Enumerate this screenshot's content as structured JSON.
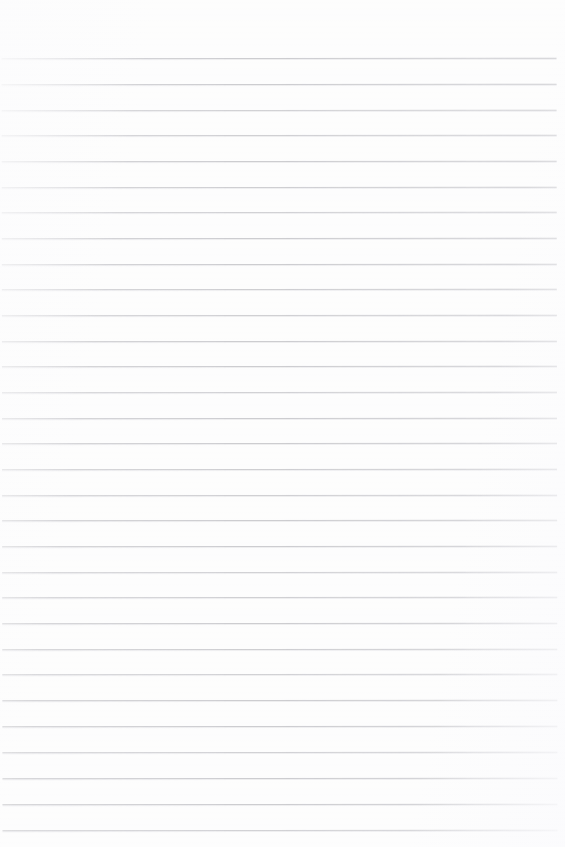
{
  "document": {
    "kind": "ruled-paper-scan",
    "title": "Blank Ruled Paper",
    "page_width": 565,
    "page_height": 847,
    "background_color": "#fdfdfd",
    "has_text_content": false,
    "body_text": "",
    "margins": {
      "top": 58,
      "bottom": 17,
      "left": 2,
      "right": 8
    }
  },
  "ruling": {
    "line_color": "#c9c9cd",
    "line_thickness_px": 1,
    "line_spacing_px": 25.8,
    "line_count": 31,
    "first_line_y": 58,
    "last_line_y": 830,
    "line_start_x": 2,
    "line_end_x": 557,
    "tilt_degrees": -0.07,
    "lines": [
      {
        "index": 1,
        "y": 58,
        "x1": 2,
        "x2": 557
      },
      {
        "index": 2,
        "y": 84,
        "x1": 2,
        "x2": 557
      },
      {
        "index": 3,
        "y": 110,
        "x1": 2,
        "x2": 557
      },
      {
        "index": 4,
        "y": 135,
        "x1": 2,
        "x2": 557
      },
      {
        "index": 5,
        "y": 161,
        "x1": 2,
        "x2": 557
      },
      {
        "index": 6,
        "y": 187,
        "x1": 2,
        "x2": 557
      },
      {
        "index": 7,
        "y": 212,
        "x1": 2,
        "x2": 557
      },
      {
        "index": 8,
        "y": 238,
        "x1": 2,
        "x2": 557
      },
      {
        "index": 9,
        "y": 264,
        "x1": 2,
        "x2": 557
      },
      {
        "index": 10,
        "y": 289,
        "x1": 2,
        "x2": 557
      },
      {
        "index": 11,
        "y": 315,
        "x1": 2,
        "x2": 557
      },
      {
        "index": 12,
        "y": 341,
        "x1": 2,
        "x2": 557
      },
      {
        "index": 13,
        "y": 366,
        "x1": 2,
        "x2": 557
      },
      {
        "index": 14,
        "y": 392,
        "x1": 2,
        "x2": 557
      },
      {
        "index": 15,
        "y": 418,
        "x1": 2,
        "x2": 557
      },
      {
        "index": 16,
        "y": 443,
        "x1": 2,
        "x2": 557
      },
      {
        "index": 17,
        "y": 469,
        "x1": 2,
        "x2": 557
      },
      {
        "index": 18,
        "y": 495,
        "x1": 2,
        "x2": 557
      },
      {
        "index": 19,
        "y": 520,
        "x1": 2,
        "x2": 557
      },
      {
        "index": 20,
        "y": 546,
        "x1": 2,
        "x2": 557
      },
      {
        "index": 21,
        "y": 572,
        "x1": 2,
        "x2": 557
      },
      {
        "index": 22,
        "y": 597,
        "x1": 2,
        "x2": 557
      },
      {
        "index": 23,
        "y": 623,
        "x1": 2,
        "x2": 557
      },
      {
        "index": 24,
        "y": 649,
        "x1": 2,
        "x2": 557
      },
      {
        "index": 25,
        "y": 674,
        "x1": 2,
        "x2": 557
      },
      {
        "index": 26,
        "y": 700,
        "x1": 2,
        "x2": 557
      },
      {
        "index": 27,
        "y": 726,
        "x1": 2,
        "x2": 557
      },
      {
        "index": 28,
        "y": 752,
        "x1": 2,
        "x2": 557
      },
      {
        "index": 29,
        "y": 778,
        "x1": 2,
        "x2": 557
      },
      {
        "index": 30,
        "y": 804,
        "x1": 2,
        "x2": 557
      },
      {
        "index": 31,
        "y": 830,
        "x1": 2,
        "x2": 557
      }
    ]
  }
}
